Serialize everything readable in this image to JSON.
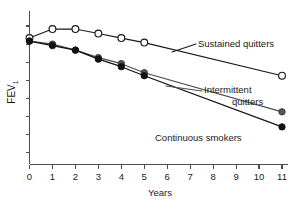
{
  "chart_data": {
    "type": "line",
    "title": "",
    "xlabel": "Years",
    "ylabel": "FEV",
    "ylabel_subscript": "1",
    "xlim": [
      0,
      11
    ],
    "ylim": [
      0,
      100
    ],
    "grid": false,
    "legend_position": "inline-annotations",
    "x_ticks": [
      "0",
      "1",
      "2",
      "3",
      "4",
      "5",
      "6",
      "7",
      "8",
      "9",
      "10",
      "11"
    ],
    "x_tick_values": [
      0,
      1,
      2,
      3,
      4,
      5,
      6,
      7,
      8,
      9,
      10,
      11
    ],
    "y_ticks": [
      "",
      "",
      "",
      "",
      "",
      "",
      "",
      ""
    ],
    "y_tick_values": [
      8,
      20,
      32,
      44,
      56,
      68,
      80,
      92
    ],
    "y_axis_labeled": false,
    "x": [
      0,
      1,
      2,
      3,
      4,
      5,
      11
    ],
    "series": [
      {
        "name": "Sustained quitters",
        "values": [
          84,
          90,
          90,
          87,
          84,
          81,
          59
        ],
        "marker": "open-circle",
        "marker_fill": "#ffffff",
        "marker_edge": "#1a1a1a",
        "line_color": "#1a1a1a"
      },
      {
        "name": "Intermittent quitters",
        "values": [
          82,
          80,
          76,
          71,
          67,
          61,
          35
        ],
        "marker": "filled-circle",
        "marker_fill": "#555555",
        "marker_edge": "#333333",
        "line_color": "#4d4d4d"
      },
      {
        "name": "Continuous smokers",
        "values": [
          82,
          79,
          76,
          70,
          65,
          59,
          25
        ],
        "marker": "filled-circle",
        "marker_fill": "#111111",
        "marker_edge": "#111111",
        "line_color": "#111111"
      }
    ],
    "annotations": [
      {
        "text": "Sustained quitters",
        "lines": [
          "Sustained quitters"
        ],
        "series": "Sustained quitters"
      },
      {
        "text": "Intermittent quitters",
        "lines": [
          "Intermittent",
          "quitters"
        ],
        "series": "Intermittent quitters"
      },
      {
        "text": "Continuous smokers",
        "lines": [
          "Continuous smokers"
        ],
        "series": "Continuous smokers"
      }
    ],
    "colors": {
      "axis": "#4d4d4d",
      "text": "#1a1a1a",
      "sustained": "#1a1a1a",
      "intermittent": "#4d4d4d",
      "continuous": "#111111"
    }
  },
  "annotation_labels": {
    "sustained": "Sustained quitters",
    "intermittent_line1": "Intermittent",
    "intermittent_line2": "quitters",
    "continuous": "Continuous smokers"
  },
  "axis": {
    "x_title": "Years",
    "y_title": "FEV",
    "y_title_sub": "1"
  }
}
